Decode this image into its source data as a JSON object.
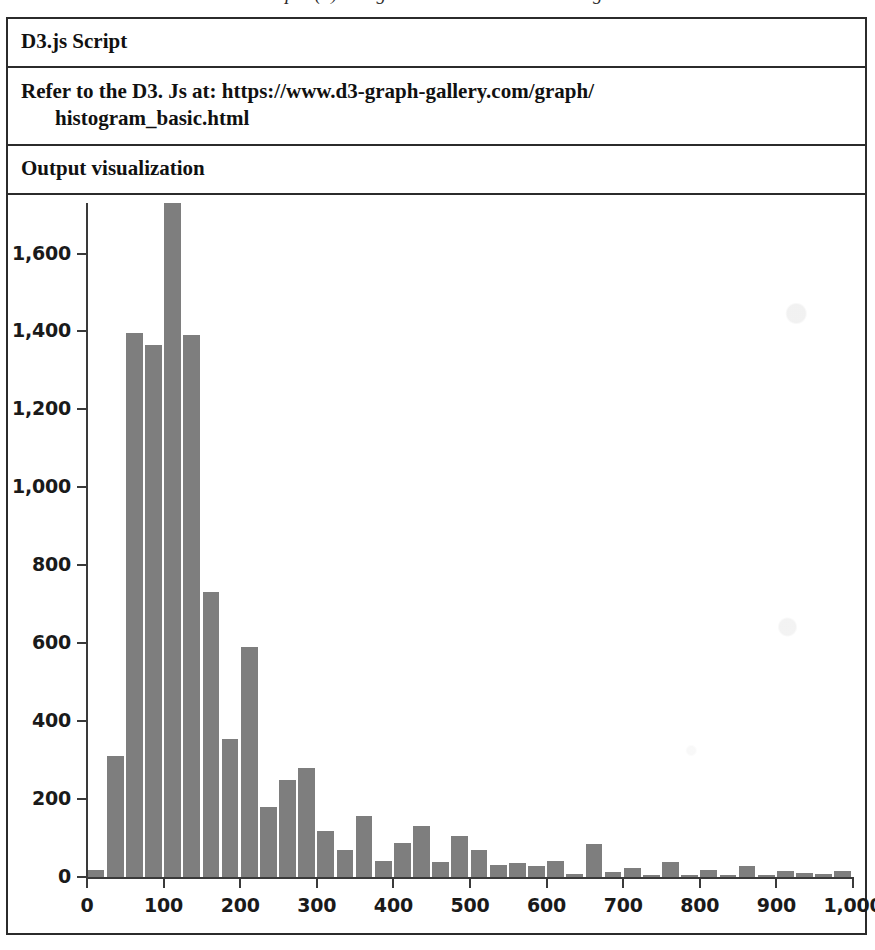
{
  "page": {
    "cut_off_line": "Example (a) using the D3 Js to build a histogram"
  },
  "table": {
    "rows": [
      {
        "name": "script-title",
        "text": "D3.js Script"
      },
      {
        "name": "reference-url",
        "text": "Refer to the D3. Js at: https://www.d3-graph-gallery.com/graph/",
        "text_cont": "histogram_basic.html"
      },
      {
        "name": "output-heading",
        "text": "Output visualization"
      }
    ]
  },
  "colors": {
    "bar_fill": "#7e7e7e",
    "axis": "#3a3a3a",
    "border": "#2b2b2b",
    "text": "#111111",
    "background": "#ffffff"
  },
  "chart_data": {
    "type": "bar",
    "title": "",
    "subtitle": "",
    "xlabel": "",
    "ylabel": "",
    "grid": false,
    "legend": null,
    "xlim": [
      0,
      1000
    ],
    "ylim": [
      0,
      1730
    ],
    "bin_width": 25,
    "xticks": [
      0,
      100,
      200,
      300,
      400,
      500,
      600,
      700,
      800,
      900,
      1000
    ],
    "xtick_labels": [
      "0",
      "100",
      "200",
      "300",
      "400",
      "500",
      "600",
      "700",
      "800",
      "900",
      "1,000"
    ],
    "yticks": [
      0,
      200,
      400,
      600,
      800,
      1000,
      1200,
      1400,
      1600
    ],
    "ytick_labels": [
      "0",
      "200",
      "400",
      "600",
      "800",
      "1,000",
      "1,200",
      "1,400",
      "1,600"
    ],
    "categories": [
      12,
      37,
      62,
      87,
      112,
      137,
      162,
      187,
      212,
      237,
      262,
      287,
      312,
      337,
      362,
      387,
      412,
      437,
      462,
      487,
      512,
      537,
      562,
      587,
      612,
      637,
      662,
      687,
      712,
      737,
      762,
      787,
      812,
      837,
      862,
      887,
      912,
      937,
      962,
      987
    ],
    "values": [
      18,
      310,
      1395,
      1365,
      1730,
      1390,
      730,
      355,
      590,
      180,
      248,
      280,
      118,
      68,
      155,
      40,
      88,
      130,
      38,
      105,
      68,
      30,
      35,
      28,
      40,
      8,
      85,
      12,
      22,
      5,
      38,
      5,
      18,
      4,
      28,
      5,
      16,
      10,
      8,
      15
    ]
  }
}
